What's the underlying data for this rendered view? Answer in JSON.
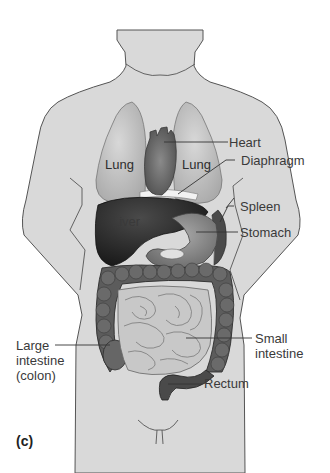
{
  "figure": {
    "panel_label": "(c)",
    "colors": {
      "body_fill": "#d9d9d9",
      "body_stroke": "#555555",
      "lung": "#c6c6c6",
      "heart": "#6e6e6e",
      "liver": "#2a2a2a",
      "stomach": "#8a8a8a",
      "large_intestine": "#5a5a5a",
      "small_intestine": "#c4c4c4",
      "leader_line": "#333333",
      "text": "#3a3a3a"
    },
    "organ_labels": {
      "lung_left": "Lung",
      "lung_right": "Lung",
      "liver": "Liver"
    },
    "callouts": [
      {
        "id": "heart",
        "text": "Heart"
      },
      {
        "id": "diaphragm",
        "text": "Diaphragm"
      },
      {
        "id": "spleen",
        "text": "Spleen"
      },
      {
        "id": "stomach",
        "text": "Stomach"
      },
      {
        "id": "small_intestine",
        "lines": [
          "Small",
          "intestine"
        ]
      },
      {
        "id": "large_intestine",
        "lines": [
          "Large",
          "intestine",
          "(colon)"
        ]
      },
      {
        "id": "rectum",
        "text": "Rectum"
      }
    ]
  }
}
